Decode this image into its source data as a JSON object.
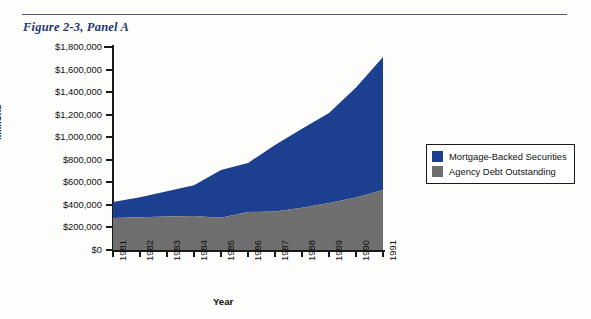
{
  "figure": {
    "title": "Figure 2-3, Panel A"
  },
  "legend": {
    "items": [
      {
        "label": "Mortgage-Backed Securities",
        "color": "#1d3f8f",
        "swatch_name": "legend-swatch-mortgage-backed-securities"
      },
      {
        "label": "Agency Debt Outstanding",
        "color": "#6f6f6f",
        "swatch_name": "legend-swatch-agency-debt-outstanding"
      }
    ]
  },
  "chart_data": {
    "type": "area",
    "stacked": true,
    "title": "Figure 2-3, Panel A",
    "xlabel": "Year",
    "ylabel": "Millions",
    "ylim": [
      0,
      1800000
    ],
    "ytick_step": 200000,
    "grid": false,
    "legend_position": "right",
    "categories": [
      "1981",
      "1982",
      "1983",
      "1984",
      "1985",
      "1986",
      "1987",
      "1988",
      "1989",
      "1990",
      "1991"
    ],
    "ytick_labels": [
      "$0",
      "$200,000",
      "$400,000",
      "$600,000",
      "$800,000",
      "$1,000,000",
      "$1,200,000",
      "$1,400,000",
      "$1,600,000",
      "$1,800,000"
    ],
    "series": [
      {
        "name": "Agency Debt Outstanding",
        "color": "#6f6f6f",
        "values": [
          284000,
          290000,
          296000,
          301000,
          285000,
          337000,
          341000,
          375000,
          417000,
          465000,
          532000
        ]
      },
      {
        "name": "Mortgage-Backed Securities",
        "color": "#1d3f8f",
        "values": [
          141000,
          178000,
          224000,
          274000,
          424000,
          435000,
          590000,
          700000,
          798000,
          975000,
          1179000
        ]
      }
    ],
    "totals": [
      425000,
      468000,
      520000,
      575000,
      709000,
      772000,
      931000,
      1075000,
      1215000,
      1440000,
      1711000
    ]
  }
}
